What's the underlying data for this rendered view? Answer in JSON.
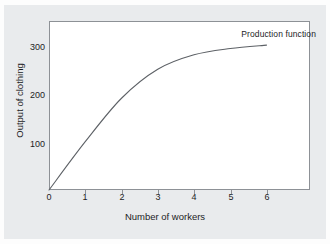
{
  "chart_data": {
    "type": "line",
    "title": "",
    "xlabel": "Number of workers",
    "ylabel": "Output of clothing",
    "xlim": [
      0,
      7.2
    ],
    "ylim": [
      0,
      350
    ],
    "xticks": [
      "0",
      "1",
      "2",
      "3",
      "4",
      "5",
      "6"
    ],
    "xtick_values": [
      0,
      1,
      2,
      3,
      4,
      5,
      6
    ],
    "yticks": [
      "100",
      "200",
      "300"
    ],
    "ytick_values": [
      100,
      200,
      300
    ],
    "grid": false,
    "legend_position": "upper-right-inline",
    "series": [
      {
        "name": "Production function",
        "x": [
          0,
          1,
          2,
          3,
          4,
          5,
          6
        ],
        "values": [
          0,
          100,
          190,
          250,
          280,
          293,
          300
        ]
      }
    ],
    "annotations": [
      {
        "name": "Production function",
        "text": "Production function",
        "x": 6.0,
        "y": 330
      }
    ],
    "colors": {
      "curve": "#5d6166",
      "axis": "#8d9196",
      "plot_background": "#ffffff",
      "figure_background": "#e9ebed",
      "text": "#1d1d1f"
    }
  },
  "labels": {
    "series_label": "Production function",
    "x_axis_title": "Number of workers",
    "y_axis_title": "Output of clothing"
  }
}
